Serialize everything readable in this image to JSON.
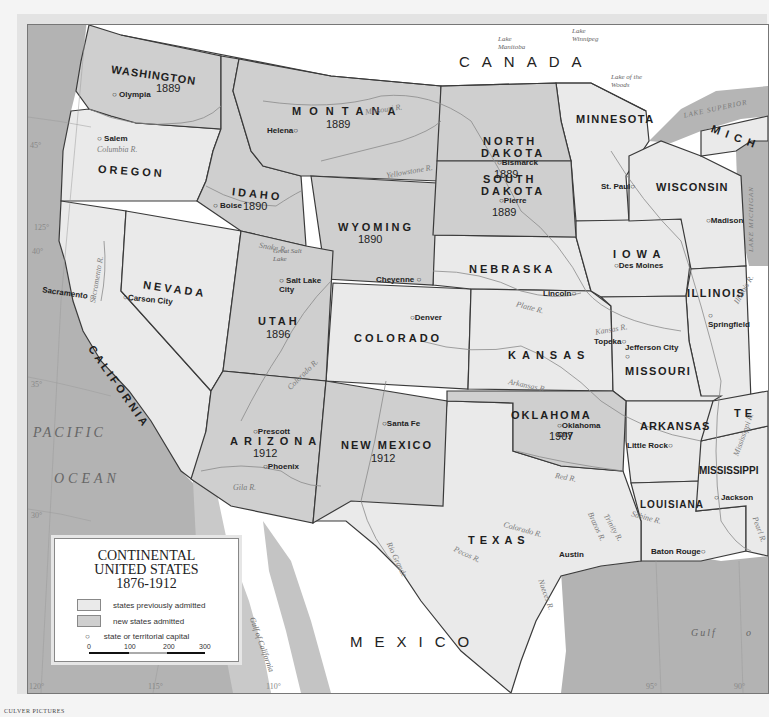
{
  "colors": {
    "previously_admitted": "#eaeaea",
    "new_states": "#cfcfcf",
    "water": "#b3b3b3",
    "foreign_land": "#ffffff",
    "border": "#3a3a3a"
  },
  "legend": {
    "title_line1": "CONTINENTAL",
    "title_line2": "UNITED STATES",
    "title_line3": "1876-1912",
    "items": [
      {
        "label": "states previously admitted",
        "symbol": "swatch-light"
      },
      {
        "label": "new states admitted",
        "symbol": "swatch-dark"
      },
      {
        "label": "state or territorial capital",
        "symbol": "circle"
      }
    ],
    "scale": {
      "ticks": [
        "0",
        "100",
        "200",
        "300"
      ]
    }
  },
  "countries": {
    "canada": "CANADA",
    "mexico": "MEXICO"
  },
  "water": {
    "pacific": "PACIFIC",
    "ocean": "OCEAN",
    "gulf": "Gulf",
    "gulf_o": "o",
    "gulf_california": "Gulf of California",
    "lake_manitoba": "Lake Manitoba",
    "lake_winnipeg": "Lake Winnipeg",
    "lake_woods": "Lake of the Woods",
    "lake_superior": "LAKE SUPERIOR",
    "lake_michigan": "LAKE MICHIGAN",
    "great_salt_lake": "Great Salt Lake"
  },
  "states": {
    "washington": {
      "name": "WASHINGTON",
      "year": "1889",
      "capital": "Olympia"
    },
    "oregon": {
      "name": "OREGON",
      "capital": "Salem"
    },
    "california": {
      "name": "CALIFORNIA",
      "capital": "Sacramento"
    },
    "nevada": {
      "name": "NEVADA",
      "capital": "Carson City"
    },
    "idaho": {
      "name": "IDAHO",
      "year": "1890",
      "capital": "Boise"
    },
    "montana": {
      "name": "MONTANA",
      "year": "1889",
      "capital": "Helena"
    },
    "wyoming": {
      "name": "WYOMING",
      "year": "1890",
      "capital": "Cheyenne"
    },
    "utah": {
      "name": "UTAH",
      "year": "1896",
      "capital": "Salt Lake City"
    },
    "colorado": {
      "name": "COLORADO",
      "capital": "Denver"
    },
    "arizona": {
      "name": "ARIZONA",
      "year": "1912",
      "capital": "Phoenix",
      "capital2": "Prescott"
    },
    "new_mexico": {
      "name": "NEW MEXICO",
      "year": "1912",
      "capital": "Santa Fe"
    },
    "north_dakota": {
      "name1": "NORTH",
      "name2": "DAKOTA",
      "year": "1889",
      "capital": "Bismarck"
    },
    "south_dakota": {
      "name1": "SOUTH",
      "name2": "DAKOTA",
      "year": "1889",
      "capital": "Pierre"
    },
    "nebraska": {
      "name": "NEBRASKA",
      "capital": "Lincoln"
    },
    "kansas": {
      "name": "KANSAS",
      "capital": "Topeka"
    },
    "oklahoma": {
      "name": "OKLAHOMA",
      "year": "1907",
      "capital": "Oklahoma City"
    },
    "texas": {
      "name": "TEXAS",
      "capital": "Austin"
    },
    "minnesota": {
      "name": "MINNESOTA",
      "capital": "St. Paul"
    },
    "iowa": {
      "name": "IOWA",
      "capital": "Des Moines"
    },
    "missouri": {
      "name": "MISSOURI",
      "capital": "Jefferson City"
    },
    "arkansas": {
      "name": "ARKANSAS",
      "capital": "Little Rock"
    },
    "louisiana": {
      "name": "LOUISIANA",
      "capital": "Baton Rouge"
    },
    "wisconsin": {
      "name": "WISCONSIN",
      "capital": "Madison"
    },
    "illinois": {
      "name": "ILLINOIS",
      "capital": "Springfield"
    },
    "mississippi": {
      "name": "MISSISSIPPI",
      "capital": "Jackson"
    },
    "michigan": {
      "name": "MICH"
    },
    "tennessee": {
      "name": "TE"
    }
  },
  "rivers": {
    "columbia": "Columbia R.",
    "missouri": "Missouri R.",
    "yellowstone": "Yellowstone R.",
    "snake": "Snake R.",
    "sacramento": "Sacramento R.",
    "colorado": "Colorado R.",
    "platte": "Platte R.",
    "kansas": "Kansas R.",
    "arkansas": "Arkansas R.",
    "red": "Red R.",
    "gila": "Gila R.",
    "rio_grande": "Rio Grande",
    "pecos": "Pecos R.",
    "colorado_tx": "Colorado R.",
    "brazos": "Brazos R.",
    "trinity": "Trinity R.",
    "sabine": "Sabine R.",
    "nueces": "Nueces R.",
    "mississippi": "Mississippi R.",
    "illinois": "Illinois R.",
    "pearl": "Pearl R."
  },
  "graticule": {
    "lat45": "45°",
    "lat40": "40°",
    "lat35": "35°",
    "lat30": "30°",
    "lon125": "125°",
    "lon120": "120°",
    "lon115": "115°",
    "lon110": "110°",
    "lon95": "95°",
    "lon90": "90°"
  },
  "credit": "CULVER PICTURES"
}
